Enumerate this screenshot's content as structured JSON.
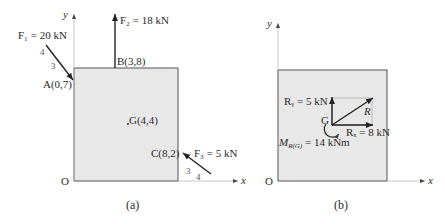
{
  "panel_a": {
    "caption": "(a)",
    "axis_y": "y",
    "axis_x": "x",
    "origin": "O",
    "forces": {
      "f1": {
        "label": "F₁ = 20 kN",
        "slope_a": "4",
        "slope_b": "3",
        "point": "A(0,7)"
      },
      "f2": {
        "label": "F₂ = 18 kN",
        "point": "B(3,8)"
      },
      "f3": {
        "label": "F₃ = 5 kN",
        "slope_a": "3",
        "slope_b": "4",
        "point": "C(8,2)"
      }
    },
    "centroid": "G(4,4)"
  },
  "panel_b": {
    "caption": "(b)",
    "axis_y": "y",
    "axis_x": "x",
    "origin": "O",
    "centroid": "G",
    "ry": "Rᵧ = 5 kN",
    "rx": "Rₓ = 8 kN",
    "r": "R",
    "moment": "M",
    "moment_sub": "R(G)",
    "moment_val": " = 14 kNm"
  },
  "colors": {
    "plate_fill": "#e8e8e8",
    "plate_stroke": "#555555",
    "arrow": "#222222"
  }
}
